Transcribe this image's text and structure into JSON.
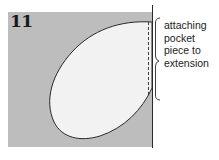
{
  "diagram": {
    "step_number": "11",
    "callout": {
      "lines": [
        "attaching",
        "pocket",
        "piece to",
        "extension"
      ],
      "text": "attaching pocket piece to extension"
    },
    "elements": {
      "background_panel": "garment extension (grey fabric)",
      "pocket_piece": "oval pocket piece (light fabric)",
      "seam_line": "dashed stitching line along right edge",
      "edge_line": "solid vertical edge line",
      "bracket": "curly brace indicating stitched section"
    },
    "colors": {
      "panel_fill": "#bdbdbd",
      "pocket_fill": "#f2f2f2",
      "outline": "#2a2a2a",
      "text": "#222222",
      "background": "#ffffff"
    }
  }
}
